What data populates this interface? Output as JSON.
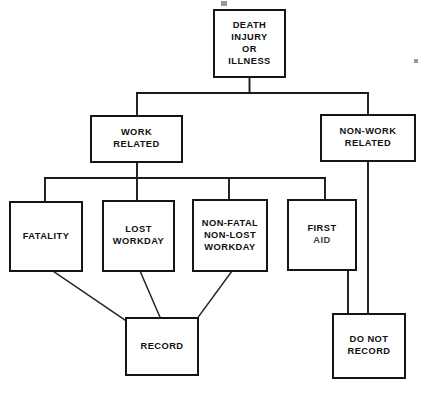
{
  "diagram": {
    "type": "flowchart",
    "background_color": "#ffffff",
    "line_color": "#151515",
    "text_color": "#101010",
    "nodes": [
      {
        "id": "root",
        "name": "death-injury-or-illness",
        "lines": [
          "DEATH",
          "INJURY",
          "OR",
          "ILLNESS"
        ],
        "x": 214,
        "y": 10,
        "w": 71,
        "h": 67,
        "level": 0
      },
      {
        "id": "work",
        "name": "work-related",
        "lines": [
          "WORK",
          "RELATED"
        ],
        "x": 91,
        "y": 116,
        "w": 91,
        "h": 46,
        "level": 1
      },
      {
        "id": "nonwork",
        "name": "non-work-related",
        "lines": [
          "NON-WORK",
          "RELATED"
        ],
        "x": 321,
        "y": 115,
        "w": 94,
        "h": 46,
        "level": 1
      },
      {
        "id": "fatality",
        "name": "fatality",
        "lines": [
          "FATALITY"
        ],
        "x": 10,
        "y": 202,
        "w": 72,
        "h": 69,
        "level": 2
      },
      {
        "id": "lost",
        "name": "lost-workday",
        "lines": [
          "LOST",
          "WORKDAY"
        ],
        "x": 103,
        "y": 201,
        "w": 71,
        "h": 70,
        "level": 2
      },
      {
        "id": "nonfatal",
        "name": "non-fatal-non-lost-workday",
        "lines": [
          "NON-FATAL",
          "NON-LOST",
          "WORKDAY"
        ],
        "x": 193,
        "y": 200,
        "w": 74,
        "h": 71,
        "level": 2
      },
      {
        "id": "firstaid",
        "name": "first-aid",
        "lines": [
          "FIRST",
          "AID"
        ],
        "x": 288,
        "y": 200,
        "w": 68,
        "h": 70,
        "level": 2,
        "degraded_line_index": 1
      },
      {
        "id": "record",
        "name": "record",
        "lines": [
          "RECORD"
        ],
        "x": 126,
        "y": 318,
        "w": 72,
        "h": 57,
        "level": 3
      },
      {
        "id": "donotrecord",
        "name": "do-not-record",
        "lines": [
          "DO NOT",
          "RECORD"
        ],
        "x": 333,
        "y": 314,
        "w": 72,
        "h": 64,
        "level": 3
      }
    ],
    "connectors": [
      {
        "name": "root-stem-down",
        "d": "M 249.5 77 L 249.5 93"
      },
      {
        "name": "level1-bus",
        "d": "M 137 93 L 368 93"
      },
      {
        "name": "bus-to-work-related",
        "d": "M 137 93 L 137 116"
      },
      {
        "name": "bus-to-non-work-related",
        "d": "M 368 93 L 368 115"
      },
      {
        "name": "work-related-stem-down",
        "d": "M 137 162 L 137 178"
      },
      {
        "name": "level2-bus",
        "d": "M 45 178 L 325 178"
      },
      {
        "name": "bus-to-fatality",
        "d": "M 45 178 L 45 202"
      },
      {
        "name": "bus-to-lost-workday",
        "d": "M 137 178 L 137 201"
      },
      {
        "name": "bus-to-non-fatal",
        "d": "M 229 178 L 229 200"
      },
      {
        "name": "bus-to-first-aid",
        "d": "M 325 178 L 325 200"
      },
      {
        "name": "non-work-related-long-drop",
        "d": "M 368 161 L 368 314"
      },
      {
        "name": "first-aid-to-do-not-record",
        "d": "M 348 270 L 348 314"
      },
      {
        "name": "fatality-to-record",
        "d": "M 53 271 L 141 331"
      },
      {
        "name": "lost-workday-to-record",
        "d": "M 140 271 L 166 331"
      },
      {
        "name": "non-fatal-to-record",
        "d": "M 232 271 L 188 331"
      }
    ],
    "specks": [
      {
        "name": "scan-speck-top",
        "x": 221,
        "y": 1,
        "w": 6,
        "h": 5
      },
      {
        "name": "scan-speck-right",
        "x": 414,
        "y": 59,
        "w": 4,
        "h": 4
      }
    ]
  }
}
